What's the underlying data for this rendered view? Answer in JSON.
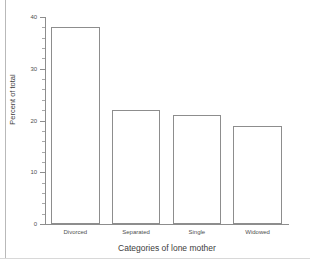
{
  "chart_data": {
    "type": "bar",
    "title": "",
    "subtitle": "",
    "xlabel": "Categories of lone mother",
    "ylabel": "Percent of total",
    "categories": [
      "Divorced",
      "Separated",
      "Single",
      "Widowed"
    ],
    "values": [
      38,
      22,
      21,
      19
    ],
    "ylim": [
      0,
      40
    ],
    "xlim": [
      0,
      4
    ],
    "y_major_ticks": [
      0,
      10,
      20,
      30,
      40
    ],
    "y_tick_labels": [
      "0",
      "10",
      "20",
      "30",
      "40"
    ],
    "y_minor_tick_interval": 2,
    "grid": false,
    "legend": false,
    "legend_position": "none",
    "series": [
      {
        "name": "Percent of total",
        "values": [
          38,
          22,
          21,
          19
        ],
        "bar_fill": "#ffffff",
        "bar_outline": "#8d8d8d"
      }
    ],
    "colors": {
      "axis": "#8d8d8d",
      "text": "#3d3d3d",
      "tick_text": "#4f4f4f",
      "background": "#ffffff",
      "bar_fill": "#ffffff",
      "bar_outline": "#8d8d8d"
    },
    "annotations": []
  }
}
